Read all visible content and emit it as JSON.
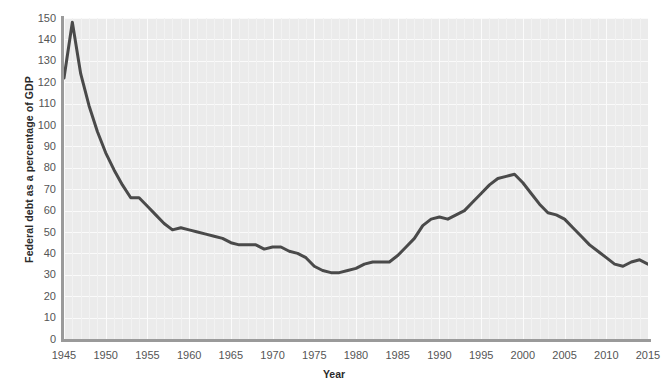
{
  "top_clipped_text": "· ·    ·  ·    ·       ·   ·        ·",
  "axes": {
    "y_title": "Federal debt as a percentage of GDP",
    "x_title": "Year",
    "y_ticks": [
      0,
      10,
      20,
      30,
      40,
      50,
      60,
      70,
      80,
      90,
      100,
      110,
      120,
      130,
      140,
      150
    ],
    "x_ticks": [
      1945,
      1950,
      1955,
      1960,
      1965,
      1970,
      1975,
      1980,
      1985,
      1990,
      1995,
      2000,
      2005,
      2010,
      2015
    ]
  },
  "style": {
    "plot_background": "#ebebeb",
    "gridline_color": "#fafafa",
    "line_color": "#4a4a4a",
    "axis_color": "#9a9a9a",
    "tick_label_color": "#555555",
    "line_width": 3
  },
  "chart_data": {
    "type": "line",
    "title": "",
    "xlabel": "Year",
    "ylabel": "Federal debt as a percentage of GDP",
    "xlim": [
      1945,
      2015
    ],
    "ylim": [
      0,
      150
    ],
    "grid": true,
    "legend": "none",
    "series": [
      {
        "name": "Federal debt held by the public as a percentage of GDP",
        "x": [
          1945,
          1946,
          1947,
          1948,
          1949,
          1950,
          1951,
          1952,
          1953,
          1954,
          1955,
          1956,
          1957,
          1958,
          1959,
          1960,
          1961,
          1962,
          1963,
          1964,
          1965,
          1966,
          1967,
          1968,
          1969,
          1970,
          1971,
          1972,
          1973,
          1974,
          1975,
          1976,
          1977,
          1978,
          1979,
          1980,
          1981,
          1982,
          1983,
          1984,
          1985,
          1986,
          1987,
          1988,
          1989,
          1990,
          1991,
          1992,
          1993,
          1994,
          1995,
          1996,
          1997,
          1998,
          1999,
          2000,
          2001,
          2002,
          2003,
          2004,
          2005,
          2006,
          2007,
          2008,
          2009,
          2010,
          2011,
          2012,
          2013,
          2014,
          2015
        ],
        "y": [
          122,
          148,
          124,
          109,
          97,
          87,
          79,
          72,
          66,
          66,
          62,
          58,
          54,
          51,
          52,
          51,
          50,
          49,
          48,
          47,
          45,
          44,
          44,
          44,
          42,
          43,
          43,
          41,
          40,
          38,
          34,
          32,
          31,
          31,
          32,
          33,
          35,
          36,
          36,
          36,
          39,
          43,
          47,
          53,
          56,
          57,
          56,
          58,
          60,
          64,
          68,
          72,
          75,
          76,
          77,
          73,
          68,
          63,
          59,
          58,
          56,
          52,
          48,
          44,
          41,
          38,
          35,
          34,
          36,
          37,
          35
        ]
      }
    ]
  }
}
